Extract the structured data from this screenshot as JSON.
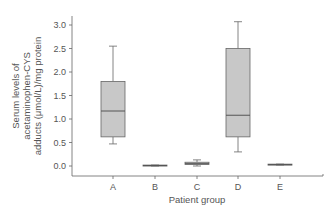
{
  "chart_data": {
    "type": "box",
    "title": "",
    "xlabel": "Patient group",
    "ylabel_lines": [
      "Serum levels of",
      "acetaminophen-CYS",
      "adducts (μmol/L)/mg protein"
    ],
    "ylim": [
      -0.2,
      3.2
    ],
    "yticks": [
      "0.0",
      "0.5",
      "1.0",
      "1.5",
      "2.0",
      "2.5",
      "3.0"
    ],
    "categories": [
      "A",
      "B",
      "C",
      "D",
      "E"
    ],
    "boxes": [
      {
        "group": "A",
        "whisker_low": 0.47,
        "q1": 0.62,
        "median": 1.17,
        "q3": 1.8,
        "whisker_high": 2.55
      },
      {
        "group": "B",
        "whisker_low": 0.0,
        "q1": 0.0,
        "median": 0.01,
        "q3": 0.02,
        "whisker_high": 0.02
      },
      {
        "group": "C",
        "whisker_low": 0.0,
        "q1": 0.03,
        "median": 0.05,
        "q3": 0.08,
        "whisker_high": 0.13
      },
      {
        "group": "D",
        "whisker_low": 0.3,
        "q1": 0.62,
        "median": 1.08,
        "q3": 2.5,
        "whisker_high": 3.07
      },
      {
        "group": "E",
        "whisker_low": 0.02,
        "q1": 0.02,
        "median": 0.03,
        "q3": 0.04,
        "whisker_high": 0.04
      }
    ],
    "box_fill": "#c8c8c8",
    "line_color": "#666666",
    "grid": false,
    "legend": null
  }
}
